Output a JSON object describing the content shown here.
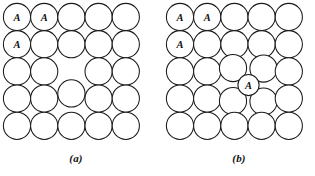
{
  "figure": {
    "background_color": "#ffffff",
    "line_color": "#1a1a1a",
    "label_color": "#111111"
  },
  "panels": [
    {
      "id": "a",
      "caption": "(a)",
      "defect_type": "vacancy",
      "grid": {
        "rows": 5,
        "cols": 5,
        "radius": 13.6,
        "spacing_x": 27.2,
        "spacing_y": 27.2,
        "origin_x": 17.0,
        "origin_y": 17.0
      },
      "atoms": [
        {
          "row": 1,
          "col": 1,
          "cx": 17.0,
          "cy": 17.0,
          "r": 13.6,
          "label": "A"
        },
        {
          "row": 1,
          "col": 2,
          "cx": 44.2,
          "cy": 17.0,
          "r": 13.6,
          "label": "A"
        },
        {
          "row": 1,
          "col": 3,
          "cx": 71.4,
          "cy": 17.0,
          "r": 13.6,
          "label": ""
        },
        {
          "row": 1,
          "col": 4,
          "cx": 98.6,
          "cy": 17.0,
          "r": 13.6,
          "label": ""
        },
        {
          "row": 1,
          "col": 5,
          "cx": 125.8,
          "cy": 17.0,
          "r": 13.6,
          "label": ""
        },
        {
          "row": 2,
          "col": 1,
          "cx": 17.0,
          "cy": 44.2,
          "r": 13.6,
          "label": "A"
        },
        {
          "row": 2,
          "col": 2,
          "cx": 44.2,
          "cy": 44.2,
          "r": 13.6,
          "label": ""
        },
        {
          "row": 2,
          "col": 3,
          "cx": 71.4,
          "cy": 44.2,
          "r": 13.6,
          "label": ""
        },
        {
          "row": 2,
          "col": 4,
          "cx": 98.6,
          "cy": 44.2,
          "r": 13.6,
          "label": ""
        },
        {
          "row": 2,
          "col": 5,
          "cx": 125.8,
          "cy": 44.2,
          "r": 13.6,
          "label": ""
        },
        {
          "row": 3,
          "col": 1,
          "cx": 17.0,
          "cy": 71.4,
          "r": 13.6,
          "label": ""
        },
        {
          "row": 3,
          "col": 2,
          "cx": 44.2,
          "cy": 71.4,
          "r": 13.6,
          "label": ""
        },
        {
          "row": 3,
          "col": 4,
          "cx": 98.6,
          "cy": 71.4,
          "r": 13.6,
          "label": ""
        },
        {
          "row": 3,
          "col": 5,
          "cx": 125.8,
          "cy": 71.4,
          "r": 13.6,
          "label": ""
        },
        {
          "row": 4,
          "col": 1,
          "cx": 17.0,
          "cy": 98.6,
          "r": 13.6,
          "label": ""
        },
        {
          "row": 4,
          "col": 2,
          "cx": 44.2,
          "cy": 98.6,
          "r": 13.6,
          "label": ""
        },
        {
          "row": 4,
          "col": 3,
          "cx": 71.4,
          "cy": 93.4,
          "r": 13.6,
          "label": ""
        },
        {
          "row": 4,
          "col": 4,
          "cx": 98.6,
          "cy": 98.6,
          "r": 13.6,
          "label": ""
        },
        {
          "row": 4,
          "col": 5,
          "cx": 125.8,
          "cy": 98.6,
          "r": 13.6,
          "label": ""
        },
        {
          "row": 5,
          "col": 1,
          "cx": 17.0,
          "cy": 125.8,
          "r": 13.6,
          "label": ""
        },
        {
          "row": 5,
          "col": 2,
          "cx": 44.2,
          "cy": 125.8,
          "r": 13.6,
          "label": ""
        },
        {
          "row": 5,
          "col": 3,
          "cx": 71.4,
          "cy": 125.8,
          "r": 13.6,
          "label": ""
        },
        {
          "row": 5,
          "col": 4,
          "cx": 98.6,
          "cy": 125.8,
          "r": 13.6,
          "label": ""
        },
        {
          "row": 5,
          "col": 5,
          "cx": 125.8,
          "cy": 125.8,
          "r": 13.6,
          "label": ""
        }
      ],
      "vacancy": {
        "row": 3,
        "col": 3,
        "cx": 71.4,
        "cy": 71.4
      }
    },
    {
      "id": "b",
      "caption": "(b)",
      "defect_type": "interstitial",
      "grid": {
        "rows": 5,
        "cols": 5,
        "radius": 13.6,
        "spacing_x": 27.2,
        "spacing_y": 27.2,
        "origin_x": 17.0,
        "origin_y": 17.0
      },
      "atoms": [
        {
          "row": 1,
          "col": 1,
          "cx": 17.0,
          "cy": 17.0,
          "r": 13.6,
          "label": "A"
        },
        {
          "row": 1,
          "col": 2,
          "cx": 44.2,
          "cy": 17.0,
          "r": 13.6,
          "label": "A"
        },
        {
          "row": 1,
          "col": 3,
          "cx": 71.4,
          "cy": 17.0,
          "r": 13.6,
          "label": ""
        },
        {
          "row": 1,
          "col": 4,
          "cx": 98.6,
          "cy": 17.0,
          "r": 13.6,
          "label": ""
        },
        {
          "row": 1,
          "col": 5,
          "cx": 125.8,
          "cy": 17.0,
          "r": 13.6,
          "label": ""
        },
        {
          "row": 2,
          "col": 1,
          "cx": 17.0,
          "cy": 44.2,
          "r": 13.6,
          "label": "A"
        },
        {
          "row": 2,
          "col": 2,
          "cx": 44.2,
          "cy": 44.2,
          "r": 13.6,
          "label": ""
        },
        {
          "row": 2,
          "col": 3,
          "cx": 71.4,
          "cy": 44.2,
          "r": 13.6,
          "label": ""
        },
        {
          "row": 2,
          "col": 4,
          "cx": 98.6,
          "cy": 44.2,
          "r": 13.6,
          "label": ""
        },
        {
          "row": 2,
          "col": 5,
          "cx": 125.8,
          "cy": 44.2,
          "r": 13.6,
          "label": ""
        },
        {
          "row": 3,
          "col": 1,
          "cx": 17.0,
          "cy": 71.4,
          "r": 13.6,
          "label": ""
        },
        {
          "row": 3,
          "col": 2,
          "cx": 44.2,
          "cy": 71.4,
          "r": 13.6,
          "label": ""
        },
        {
          "row": 3,
          "col": 3,
          "cx": 70.0,
          "cy": 68.0,
          "r": 13.6,
          "label": ""
        },
        {
          "row": 3,
          "col": 4,
          "cx": 100.5,
          "cy": 68.5,
          "r": 13.6,
          "label": ""
        },
        {
          "row": 3,
          "col": 5,
          "cx": 125.8,
          "cy": 71.4,
          "r": 13.6,
          "label": ""
        },
        {
          "row": 4,
          "col": 1,
          "cx": 17.0,
          "cy": 98.6,
          "r": 13.6,
          "label": ""
        },
        {
          "row": 4,
          "col": 2,
          "cx": 44.2,
          "cy": 98.6,
          "r": 13.6,
          "label": ""
        },
        {
          "row": 4,
          "col": 3,
          "cx": 70.0,
          "cy": 101.0,
          "r": 13.6,
          "label": ""
        },
        {
          "row": 4,
          "col": 4,
          "cx": 100.5,
          "cy": 101.5,
          "r": 13.6,
          "label": ""
        },
        {
          "row": 4,
          "col": 5,
          "cx": 125.8,
          "cy": 98.6,
          "r": 13.6,
          "label": ""
        },
        {
          "row": 5,
          "col": 1,
          "cx": 17.0,
          "cy": 125.8,
          "r": 13.6,
          "label": ""
        },
        {
          "row": 5,
          "col": 2,
          "cx": 44.2,
          "cy": 125.8,
          "r": 13.6,
          "label": ""
        },
        {
          "row": 5,
          "col": 3,
          "cx": 71.4,
          "cy": 125.8,
          "r": 13.6,
          "label": ""
        },
        {
          "row": 5,
          "col": 4,
          "cx": 98.6,
          "cy": 125.8,
          "r": 13.6,
          "label": ""
        },
        {
          "row": 5,
          "col": 5,
          "cx": 125.8,
          "cy": 125.8,
          "r": 13.6,
          "label": ""
        }
      ],
      "interstitial": {
        "cx": 85.5,
        "cy": 85.0,
        "r": 10.6,
        "label": "A"
      }
    }
  ]
}
